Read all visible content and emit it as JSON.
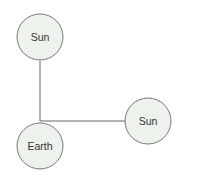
{
  "diagram": {
    "type": "node-link",
    "colors": {
      "node_fill": "#eef2ec",
      "node_stroke": "#777777",
      "edge_stroke": "#666666",
      "label": "#333333",
      "background": "#ffffff"
    },
    "nodes": [
      {
        "id": "sun_top",
        "label": "Sun"
      },
      {
        "id": "earth",
        "label": "Earth"
      },
      {
        "id": "sun_right",
        "label": "Sun"
      }
    ],
    "edges": [
      {
        "from": "earth",
        "to": "sun_top"
      },
      {
        "from": "earth",
        "to": "sun_right"
      }
    ]
  }
}
